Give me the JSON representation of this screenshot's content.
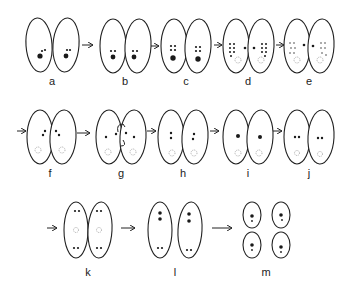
{
  "figure": {
    "stages": [
      {
        "id": "a",
        "label": "a"
      },
      {
        "id": "b",
        "label": "b"
      },
      {
        "id": "c",
        "label": "c"
      },
      {
        "id": "d",
        "label": "d"
      },
      {
        "id": "e",
        "label": "e"
      },
      {
        "id": "f",
        "label": "f"
      },
      {
        "id": "g",
        "label": "g"
      },
      {
        "id": "h",
        "label": "h"
      },
      {
        "id": "i",
        "label": "i"
      },
      {
        "id": "j",
        "label": "j"
      },
      {
        "id": "k",
        "label": "k"
      },
      {
        "id": "l",
        "label": "l"
      },
      {
        "id": "m",
        "label": "m"
      }
    ],
    "colors": {
      "stroke": "#222222",
      "nucleus": "#1a1a1a",
      "background": "#ffffff"
    }
  }
}
